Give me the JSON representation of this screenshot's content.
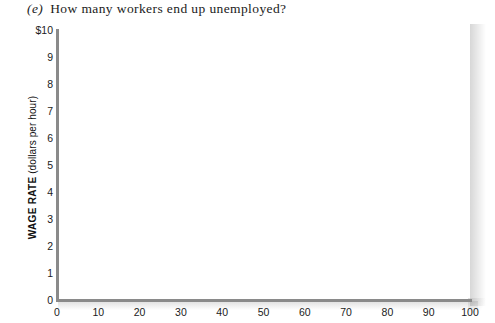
{
  "question": {
    "label": "(e)",
    "text": "How many workers end up unemployed?"
  },
  "chart_data": {
    "type": "scatter",
    "title": "",
    "xlabel": "",
    "ylabel": "WAGE RATE (dollars per hour)",
    "ylabel_main": "WAGE RATE",
    "ylabel_unit": "(dollars per hour)",
    "xlim": [
      0,
      100
    ],
    "ylim": [
      0,
      10
    ],
    "grid": false,
    "legend": null,
    "series": [],
    "x": [],
    "values": [],
    "annotations": [],
    "x_ticks": [
      "0",
      "10",
      "20",
      "30",
      "40",
      "50",
      "60",
      "70",
      "80",
      "90",
      "100"
    ],
    "x_tick_values": [
      0,
      10,
      20,
      30,
      40,
      50,
      60,
      70,
      80,
      90,
      100
    ],
    "y_ticks": [
      "$10",
      "9",
      "8",
      "7",
      "6",
      "5",
      "4",
      "3",
      "2",
      "1",
      "0"
    ],
    "y_tick_values": [
      10,
      9,
      8,
      7,
      6,
      5,
      4,
      3,
      2,
      1,
      0
    ],
    "axis_color": "#8a8a8a",
    "background_color": "#ffffff",
    "note": "blank answer grid with no plotted data"
  }
}
